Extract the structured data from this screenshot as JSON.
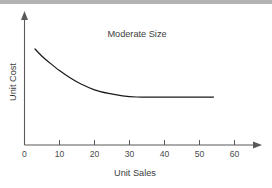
{
  "page": {
    "background_color": "#ffffff",
    "top_bar_color": "#b3b3b3"
  },
  "chart_data": {
    "type": "line",
    "title": "Moderate Size",
    "xlabel": "Unit Sales",
    "ylabel": "Unit Cost",
    "xlim": [
      0,
      65
    ],
    "ylim": [
      0,
      100
    ],
    "xticks": [
      0,
      10,
      20,
      30,
      40,
      50,
      60
    ],
    "xtick_labels": [
      "0",
      "10",
      "20",
      "30",
      "40",
      "50",
      "60"
    ],
    "yticks": [],
    "ytick_labels": [],
    "grid": false,
    "legend": null,
    "axis_style": "arrow-headed open axes",
    "line_color": "#1a1a1a",
    "annotations": [],
    "series": [
      {
        "name": "Unit Cost",
        "description": "Exponentially declining unit cost flattening to an asymptote at moderate volume",
        "x": [
          3,
          5,
          7,
          10,
          13,
          16,
          20,
          24,
          28,
          32,
          36,
          40,
          45,
          50,
          54
        ],
        "y": [
          80,
          74,
          69,
          62,
          56,
          51,
          46,
          43,
          41,
          40,
          40,
          40,
          40,
          40,
          40
        ]
      }
    ]
  }
}
